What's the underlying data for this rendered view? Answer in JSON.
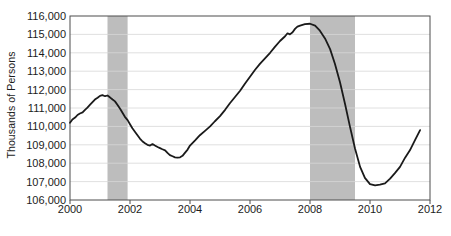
{
  "chart_data": {
    "type": "line",
    "title": "",
    "xlabel": "",
    "ylabel": "Thousands of Persons",
    "xlim": [
      2000,
      2012
    ],
    "ylim": [
      106000,
      116000
    ],
    "grid": true,
    "legend": "none",
    "yticks": [
      "106,000",
      "107,000",
      "108,000",
      "109,000",
      "110,000",
      "111,000",
      "112,000",
      "113,000",
      "114,000",
      "115,000",
      "116,000"
    ],
    "ytick_values": [
      106000,
      107000,
      108000,
      109000,
      110000,
      111000,
      112000,
      113000,
      114000,
      115000,
      116000
    ],
    "xticks": [
      "2000",
      "2002",
      "2004",
      "2006",
      "2008",
      "2010",
      "2012"
    ],
    "xtick_values": [
      2000,
      2002,
      2004,
      2006,
      2008,
      2010,
      2012
    ],
    "line_color": "#1a1a1a",
    "band_color": "#bdbdbd",
    "grid_color": "#d8d8d8",
    "axis_color": "#4d4d4d",
    "shaded_bands": [
      {
        "name": "recession-2001",
        "start": 2001.25,
        "end": 2001.92
      },
      {
        "name": "recession-2008",
        "start": 2008.0,
        "end": 2009.5
      }
    ],
    "series": [
      {
        "name": "Employment",
        "x": [
          2000.0,
          2000.08,
          2000.17,
          2000.25,
          2000.33,
          2000.42,
          2000.5,
          2000.58,
          2000.67,
          2000.75,
          2000.83,
          2000.92,
          2001.0,
          2001.08,
          2001.17,
          2001.25,
          2001.33,
          2001.42,
          2001.5,
          2001.58,
          2001.67,
          2001.75,
          2001.83,
          2001.92,
          2002.0,
          2002.08,
          2002.17,
          2002.25,
          2002.33,
          2002.42,
          2002.5,
          2002.58,
          2002.67,
          2002.75,
          2002.83,
          2002.92,
          2003.0,
          2003.08,
          2003.17,
          2003.25,
          2003.33,
          2003.42,
          2003.5,
          2003.58,
          2003.67,
          2003.75,
          2003.83,
          2003.92,
          2004.0,
          2004.17,
          2004.33,
          2004.5,
          2004.67,
          2004.83,
          2005.0,
          2005.17,
          2005.33,
          2005.5,
          2005.67,
          2005.83,
          2006.0,
          2006.17,
          2006.33,
          2006.5,
          2006.67,
          2006.83,
          2007.0,
          2007.17,
          2007.25,
          2007.33,
          2007.42,
          2007.5,
          2007.58,
          2007.67,
          2007.83,
          2008.0,
          2008.17,
          2008.33,
          2008.5,
          2008.67,
          2008.83,
          2009.0,
          2009.17,
          2009.33,
          2009.5,
          2009.67,
          2009.83,
          2010.0,
          2010.17,
          2010.33,
          2010.5,
          2010.67,
          2010.83,
          2011.0,
          2011.17,
          2011.33,
          2011.5,
          2011.67
        ],
        "values": [
          110200,
          110380,
          110480,
          110620,
          110700,
          110760,
          110900,
          111020,
          111180,
          111320,
          111460,
          111560,
          111660,
          111700,
          111640,
          111680,
          111580,
          111460,
          111360,
          111180,
          110960,
          110740,
          110520,
          110340,
          110120,
          109900,
          109700,
          109520,
          109340,
          109180,
          109080,
          109000,
          108960,
          109040,
          108960,
          108880,
          108820,
          108760,
          108700,
          108560,
          108440,
          108380,
          108320,
          108300,
          108320,
          108400,
          108560,
          108740,
          108960,
          109240,
          109520,
          109760,
          110000,
          110280,
          110560,
          110900,
          111260,
          111600,
          111940,
          112320,
          112700,
          113080,
          113400,
          113700,
          114000,
          114320,
          114640,
          114900,
          115060,
          115000,
          115120,
          115300,
          115420,
          115480,
          115560,
          115580,
          115480,
          115200,
          114780,
          114200,
          113400,
          112400,
          111200,
          110000,
          108800,
          107800,
          107200,
          106860,
          106800,
          106840,
          106900,
          107160,
          107460,
          107800,
          108300,
          108700,
          109250,
          109800
        ]
      }
    ],
    "annotations": []
  }
}
